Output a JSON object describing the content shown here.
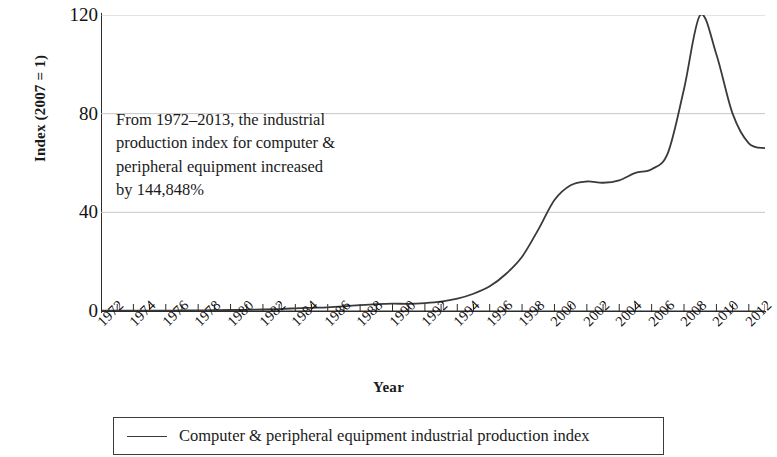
{
  "chart_data": {
    "type": "line",
    "title": "",
    "xlabel": "Year",
    "ylabel": "Index (2007 = 1)",
    "xlim": [
      1972,
      2013
    ],
    "ylim": [
      0,
      120
    ],
    "yticks": [
      0,
      40,
      80,
      120
    ],
    "ytick_labels": [
      "0",
      "40",
      "80",
      "120"
    ],
    "xtick_labels": [
      "1972",
      "1974",
      "1976",
      "1978",
      "1980",
      "1982",
      "1984",
      "1986",
      "1988",
      "1990",
      "1992",
      "1994",
      "1996",
      "1998",
      "2000",
      "2002",
      "2004",
      "2006",
      "2008",
      "2010",
      "2012"
    ],
    "grid": "horizontal",
    "legend_position": "below-plot",
    "line_color": "#3a3a3a",
    "grid_color": "#bfbfbf",
    "axis_color": "#2b2b2b",
    "series": [
      {
        "name": "Computer & peripheral equipment industrial production index",
        "x": [
          1972,
          1973,
          1974,
          1975,
          1976,
          1977,
          1978,
          1979,
          1980,
          1981,
          1982,
          1983,
          1984,
          1985,
          1986,
          1987,
          1988,
          1989,
          1990,
          1991,
          1992,
          1993,
          1994,
          1995,
          1996,
          1997,
          1998,
          1999,
          2000,
          2001,
          2002,
          2003,
          2004,
          2005,
          2006,
          2007,
          2008,
          2009,
          2010,
          2011,
          2012,
          2013
        ],
        "values": [
          0.1,
          0.12,
          0.15,
          0.15,
          0.18,
          0.2,
          0.25,
          0.3,
          0.4,
          0.5,
          0.6,
          0.8,
          1.1,
          1.3,
          1.5,
          1.9,
          2.4,
          2.8,
          3.0,
          2.9,
          3.2,
          3.8,
          5.0,
          7.0,
          10.0,
          15.0,
          22.0,
          33.0,
          45.0,
          51.0,
          52.5,
          52.0,
          53.0,
          56.0,
          57.5,
          64.0,
          90.0,
          120.0,
          104.0,
          80.0,
          68.0,
          66.0
        ]
      }
    ],
    "annotations": [
      {
        "name": "growth-note",
        "lines": [
          "From 1972–2013, the industrial",
          "production index for computer &",
          "peripheral equipment increased",
          "by 144,848%"
        ]
      }
    ]
  },
  "legend": {
    "entries": [
      {
        "label": "Computer & peripheral equipment industrial production index"
      }
    ]
  }
}
